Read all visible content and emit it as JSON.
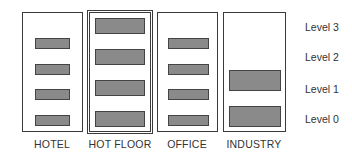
{
  "diagram": {
    "columns": [
      {
        "label": "HOTEL",
        "levels": [
          0,
          1,
          2,
          3
        ],
        "bar_style": "small"
      },
      {
        "label": "HOT FLOOR",
        "levels": [
          0,
          1,
          2,
          3
        ],
        "bar_style": "large"
      },
      {
        "label": "OFFICE",
        "levels": [
          0,
          1,
          2,
          3
        ],
        "bar_style": "small"
      },
      {
        "label": "INDUSTRY",
        "levels": [
          0,
          1
        ],
        "bar_style": "large"
      }
    ],
    "levels": [
      "Level 3",
      "Level 2",
      "Level 1",
      "Level 0"
    ],
    "colors": {
      "bar_fill": "#8a8a8a",
      "border": "#3a3a3a",
      "text": "#333333"
    }
  }
}
